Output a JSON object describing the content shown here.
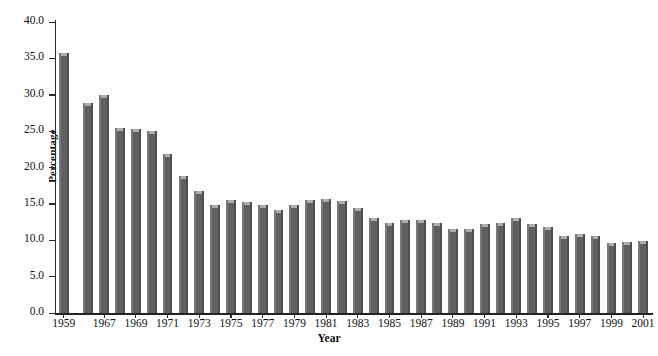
{
  "chart_data": {
    "type": "bar",
    "title": "",
    "xlabel": "Year",
    "ylabel": "Percentage",
    "ylim": [
      0.0,
      40.0
    ],
    "ytick_labels": [
      "0.0",
      "5.0",
      "10.0",
      "15.0",
      "20.0",
      "25.0",
      "30.0",
      "35.0",
      "40.0"
    ],
    "ytick_values": [
      0.0,
      5.0,
      10.0,
      15.0,
      20.0,
      25.0,
      30.0,
      35.0,
      40.0
    ],
    "grid": false,
    "legend": null,
    "bar_color": "#606060",
    "categories": [
      "1959",
      "1966",
      "1967",
      "1968",
      "1969",
      "1970",
      "1971",
      "1972",
      "1973",
      "1974",
      "1975",
      "1976",
      "1977",
      "1978",
      "1979",
      "1980",
      "1981",
      "1982",
      "1983",
      "1984",
      "1985",
      "1986",
      "1987",
      "1988",
      "1989",
      "1990",
      "1991",
      "1992",
      "1993",
      "1994",
      "1995",
      "1996",
      "1997",
      "1998",
      "1999",
      "2000",
      "2001"
    ],
    "values": [
      35.7,
      28.9,
      29.9,
      25.5,
      25.3,
      25.0,
      21.9,
      18.9,
      16.8,
      14.9,
      15.5,
      15.3,
      14.8,
      14.2,
      14.9,
      15.6,
      15.7,
      15.4,
      14.4,
      13.0,
      12.4,
      12.8,
      12.8,
      12.4,
      11.6,
      11.6,
      12.3,
      12.4,
      13.0,
      12.2,
      11.8,
      10.6,
      10.8,
      10.6,
      9.6,
      9.7,
      9.9
    ],
    "xtick_labels": [
      "1959",
      "1967",
      "1969",
      "1971",
      "1973",
      "1975",
      "1977",
      "1979",
      "1981",
      "1983",
      "1985",
      "1987",
      "1989",
      "1991",
      "1993",
      "1995",
      "1997",
      "1999",
      "2001"
    ],
    "xtick_categories": [
      "1959",
      "1967",
      "1969",
      "1971",
      "1973",
      "1975",
      "1977",
      "1979",
      "1981",
      "1983",
      "1985",
      "1987",
      "1989",
      "1991",
      "1993",
      "1995",
      "1997",
      "1999",
      "2001"
    ]
  }
}
